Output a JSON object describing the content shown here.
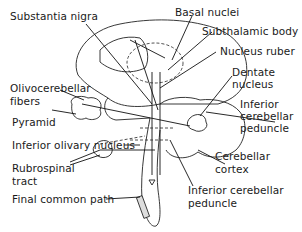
{
  "diagram": {
    "labels": [
      {
        "id": "substantia-nigra",
        "text": "Substantia nigra"
      },
      {
        "id": "basal-nuclei",
        "text": "Basal nuclei"
      },
      {
        "id": "subthalamic-body",
        "text": "Subthalamic body"
      },
      {
        "id": "nucleus-ruber",
        "text": "Nucleus ruber"
      },
      {
        "id": "dentate-nucleus-1",
        "text": "Dentate"
      },
      {
        "id": "dentate-nucleus-2",
        "text": "nucleus"
      },
      {
        "id": "olivocerebellar-1",
        "text": "Olivocerebellar"
      },
      {
        "id": "olivocerebellar-2",
        "text": "fibers"
      },
      {
        "id": "inferior-cerebellar-peduncle-top-1",
        "text": "Inferior"
      },
      {
        "id": "inferior-cerebellar-peduncle-top-2",
        "text": "cerebellar"
      },
      {
        "id": "inferior-cerebellar-peduncle-top-3",
        "text": "peduncle"
      },
      {
        "id": "pyramid",
        "text": "Pyramid"
      },
      {
        "id": "inferior-olivary-nucleus",
        "text": "Inferior olivary nucleus"
      },
      {
        "id": "cerebellar-cortex-1",
        "text": "Cerebellar"
      },
      {
        "id": "cerebellar-cortex-2",
        "text": "cortex"
      },
      {
        "id": "rubrospinal-1",
        "text": "Rubrospinal"
      },
      {
        "id": "rubrospinal-2",
        "text": "tract"
      },
      {
        "id": "inferior-cerebellar-peduncle-bottom-1",
        "text": "Inferior cerebellar"
      },
      {
        "id": "inferior-cerebellar-peduncle-bottom-2",
        "text": "peduncle"
      },
      {
        "id": "final-common-path",
        "text": "Final common path"
      }
    ]
  }
}
